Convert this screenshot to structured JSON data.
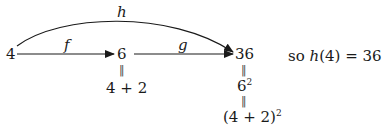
{
  "diagram": {
    "nodes": {
      "input": "4",
      "middle": "6",
      "output": "36"
    },
    "arrows": {
      "f": "f",
      "g": "g",
      "h": "h"
    },
    "middle_chain": {
      "eq_sign": "‖",
      "expr": "4 + 2"
    },
    "output_chain": {
      "eq_sign_1": "‖",
      "expr_1_base": "6",
      "expr_1_exp": "2",
      "eq_sign_2": "‖",
      "expr_2_base": "(4 + 2)",
      "expr_2_exp": "2"
    },
    "conclusion": {
      "prefix": "so",
      "func": "h",
      "arg": "(4) = 36"
    },
    "colors": {
      "ink": "#1a1a1a",
      "background": "#ffffff"
    }
  }
}
